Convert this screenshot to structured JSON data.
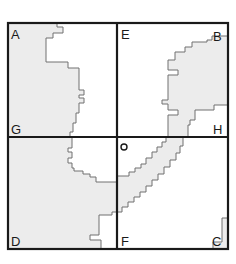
{
  "diagram": {
    "type": "region map divided into four quadrants with shaded areas",
    "labels": {
      "A": "A",
      "B": "B",
      "C": "C",
      "D": "D",
      "E": "E",
      "F": "F",
      "G": "G",
      "H": "H",
      "O": "o"
    },
    "colors": {
      "shade": "#ececec",
      "outline": "#707070",
      "frame": "#1a1a1a",
      "background": "#ffffff"
    }
  }
}
